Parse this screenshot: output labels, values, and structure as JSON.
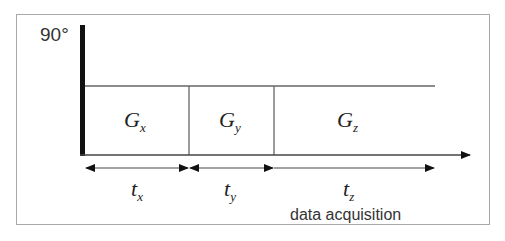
{
  "rf_pulse": {
    "label": "90°"
  },
  "gradients": [
    {
      "symbol": "G",
      "sub": "x"
    },
    {
      "symbol": "G",
      "sub": "y"
    },
    {
      "symbol": "G",
      "sub": "z"
    }
  ],
  "times": [
    {
      "symbol": "t",
      "sub": "x"
    },
    {
      "symbol": "t",
      "sub": "y"
    },
    {
      "symbol": "t",
      "sub": "z"
    }
  ],
  "annotation": {
    "data_acquisition": "data acquisition"
  }
}
